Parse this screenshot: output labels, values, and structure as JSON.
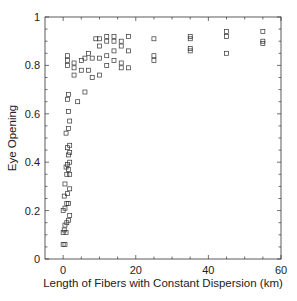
{
  "chart_data": {
    "type": "scatter",
    "title": "",
    "xlabel": "Length of Fibers with Constant Dispersion (km)",
    "ylabel": "Eye Opening",
    "xlim": [
      -5,
      60
    ],
    "ylim": [
      0,
      1
    ],
    "xticks": [
      0,
      20,
      40,
      60
    ],
    "yticks": [
      0,
      0.2,
      0.4,
      0.6,
      0.8,
      1
    ],
    "xtick_labels": [
      "0",
      "20",
      "40",
      "60"
    ],
    "ytick_labels": [
      "0",
      "0.2",
      "0.4",
      "0.6",
      "0.8",
      "1"
    ],
    "grid": false,
    "legend": null,
    "marker": "open-square",
    "series": [
      {
        "name": "Eye Opening",
        "points": [
          [
            0,
            0.06
          ],
          [
            0.5,
            0.06
          ],
          [
            0,
            0.11
          ],
          [
            0.3,
            0.12
          ],
          [
            0.8,
            0.11
          ],
          [
            0.5,
            0.14
          ],
          [
            1,
            0.15
          ],
          [
            1.5,
            0.16
          ],
          [
            1.8,
            0.18
          ],
          [
            0,
            0.2
          ],
          [
            0.5,
            0.21
          ],
          [
            1,
            0.23
          ],
          [
            1.5,
            0.23
          ],
          [
            0.3,
            0.26
          ],
          [
            1.2,
            0.27
          ],
          [
            1.8,
            0.29
          ],
          [
            0.5,
            0.31
          ],
          [
            1,
            0.35
          ],
          [
            1.8,
            0.35
          ],
          [
            1.5,
            0.37
          ],
          [
            0.8,
            0.38
          ],
          [
            1.2,
            0.39
          ],
          [
            1.8,
            0.4
          ],
          [
            1.5,
            0.43
          ],
          [
            1.8,
            0.44
          ],
          [
            1.2,
            0.46
          ],
          [
            1.8,
            0.47
          ],
          [
            0.8,
            0.52
          ],
          [
            1.5,
            0.54
          ],
          [
            1.8,
            0.57
          ],
          [
            1.5,
            0.61
          ],
          [
            1.2,
            0.66
          ],
          [
            1.5,
            0.68
          ],
          [
            1.2,
            0.8
          ],
          [
            1.2,
            0.82
          ],
          [
            1.2,
            0.84
          ],
          [
            3,
            0.76
          ],
          [
            3,
            0.79
          ],
          [
            3,
            0.81
          ],
          [
            4,
            0.65
          ],
          [
            5,
            0.78
          ],
          [
            5,
            0.82
          ],
          [
            6,
            0.83
          ],
          [
            6,
            0.69
          ],
          [
            7,
            0.78
          ],
          [
            7,
            0.85
          ],
          [
            8,
            0.75
          ],
          [
            8,
            0.83
          ],
          [
            9,
            0.91
          ],
          [
            10,
            0.76
          ],
          [
            10,
            0.83
          ],
          [
            10,
            0.88
          ],
          [
            10,
            0.91
          ],
          [
            12,
            0.8
          ],
          [
            12,
            0.84
          ],
          [
            12,
            0.9
          ],
          [
            12,
            0.92
          ],
          [
            14,
            0.82
          ],
          [
            14,
            0.86
          ],
          [
            14,
            0.9
          ],
          [
            14,
            0.92
          ],
          [
            16,
            0.79
          ],
          [
            16,
            0.81
          ],
          [
            16,
            0.88
          ],
          [
            16,
            0.9
          ],
          [
            18,
            0.79
          ],
          [
            18,
            0.86
          ],
          [
            18,
            0.92
          ],
          [
            25,
            0.82
          ],
          [
            25,
            0.84
          ],
          [
            25,
            0.91
          ],
          [
            35,
            0.86
          ],
          [
            35,
            0.87
          ],
          [
            35,
            0.91
          ],
          [
            35,
            0.92
          ],
          [
            45,
            0.85
          ],
          [
            45,
            0.92
          ],
          [
            45,
            0.94
          ],
          [
            55,
            0.89
          ],
          [
            55,
            0.9
          ],
          [
            55,
            0.94
          ]
        ]
      }
    ]
  }
}
